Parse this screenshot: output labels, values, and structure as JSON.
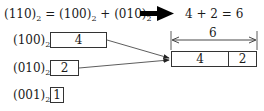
{
  "equation": {
    "lhs": "(110)",
    "lhs_sub": "2",
    "eq": "=",
    "term1": "(100)",
    "term1_sub": "2",
    "plus": "+",
    "term2": "(010)",
    "term2_sub": "2",
    "result": "4 + 2 = 6"
  },
  "rows": [
    {
      "label": "(100)",
      "sub": "2",
      "value": "4"
    },
    {
      "label": "(010)",
      "sub": "2",
      "value": "2"
    },
    {
      "label": "(001)",
      "sub": "2",
      "value": "1"
    }
  ],
  "combined": {
    "width_label": "6",
    "cells": [
      "4",
      "2"
    ]
  }
}
